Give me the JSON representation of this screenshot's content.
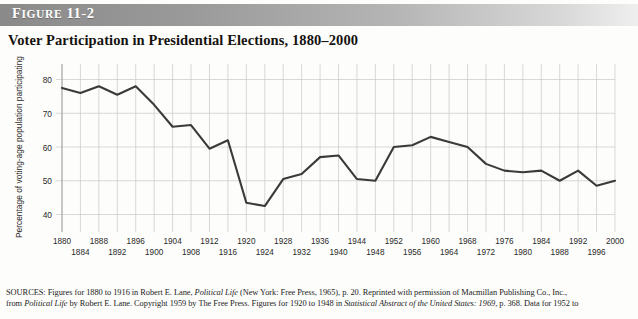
{
  "figure": {
    "band_label_small": "IGURE",
    "band_label_lead": "F",
    "band_label_number": "11-2",
    "band_label_full": "FIGURE 11-2",
    "title": "Voter Participation in Presidential Elections, 1880–2000"
  },
  "chart_data": {
    "type": "line",
    "title": "Voter Participation in Presidential Elections, 1880–2000",
    "xlabel": "",
    "ylabel": "Percentage of voting-age population participating",
    "ylim": [
      36,
      84
    ],
    "xlim": [
      1880,
      2000
    ],
    "yticks": [
      40,
      50,
      60,
      70,
      80
    ],
    "ytick_labels": [
      "40",
      "50",
      "60",
      "70",
      "80"
    ],
    "grid": true,
    "legend": "none",
    "xticks_top_row": [
      "1880",
      "1888",
      "1896",
      "1904",
      "1912",
      "1920",
      "1928",
      "1936",
      "1944",
      "1952",
      "1960",
      "1968",
      "1976",
      "1984",
      "1992",
      "2000"
    ],
    "xticks_bottom_row": [
      "1884",
      "1892",
      "1900",
      "1908",
      "1916",
      "1924",
      "1932",
      "1940",
      "1948",
      "1956",
      "1964",
      "1972",
      "1980",
      "1988",
      "1996"
    ],
    "x": [
      1880,
      1884,
      1888,
      1892,
      1896,
      1900,
      1904,
      1908,
      1912,
      1916,
      1920,
      1924,
      1928,
      1932,
      1936,
      1940,
      1944,
      1948,
      1952,
      1956,
      1960,
      1964,
      1968,
      1972,
      1976,
      1980,
      1984,
      1988,
      1992,
      1996,
      2000
    ],
    "values": [
      77.5,
      76.0,
      78.0,
      75.5,
      78.0,
      72.5,
      66.0,
      66.5,
      59.5,
      62.0,
      43.5,
      42.5,
      50.5,
      52.0,
      57.0,
      57.5,
      50.5,
      50.0,
      60.0,
      60.5,
      63.0,
      61.5,
      60.0,
      55.0,
      53.0,
      52.5,
      53.0,
      50.0,
      53.0,
      48.5,
      50.0
    ],
    "series": [
      {
        "name": "Percentage of voting-age population participating",
        "values": [
          77.5,
          76.0,
          78.0,
          75.5,
          78.0,
          72.5,
          66.0,
          66.5,
          59.5,
          62.0,
          43.5,
          42.5,
          50.5,
          52.0,
          57.0,
          57.5,
          50.5,
          50.0,
          60.0,
          60.5,
          63.0,
          61.5,
          60.0,
          55.0,
          53.0,
          52.5,
          53.0,
          50.0,
          53.0,
          48.5,
          50.0
        ],
        "color": "#3a3a3a"
      }
    ]
  },
  "sources": {
    "label": "SOURCES:",
    "line1_a": " Figures for 1880 to 1916 in Robert E. Lane, ",
    "line1_b": "Political Life",
    "line1_c": " (New York: Free Press, 1965), p. 20. Reprinted with permission of Macmillan Publishing Co., Inc.,",
    "line2_a": "from ",
    "line2_b": "Political Life",
    "line2_c": " by Robert E. Lane. Copyright 1959 by The Free Press. Figures for 1920 to 1948 in ",
    "line2_d": "Statistical Abstract of the United States: 1969",
    "line2_e": ", p. 368. Data for 1952 to"
  }
}
